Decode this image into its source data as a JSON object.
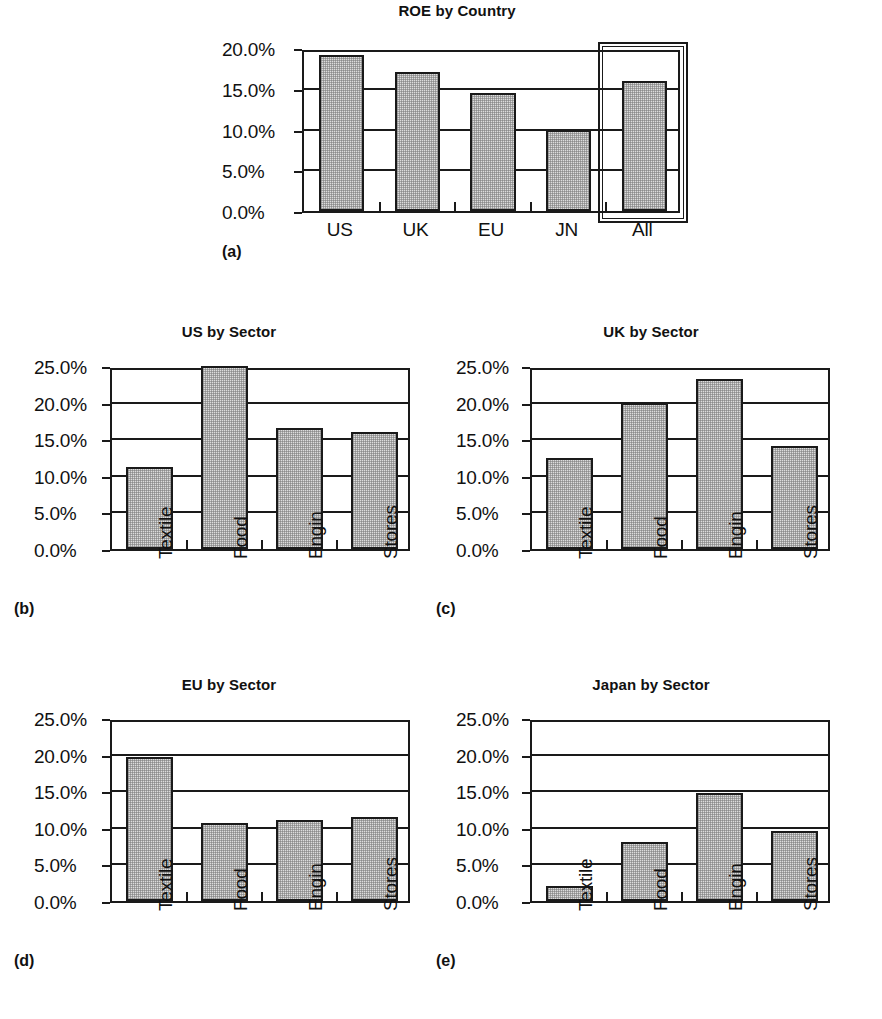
{
  "figure": {
    "background_color": "#ffffff",
    "ink_color": "#1a1a1a",
    "bar_fill_color": "#dcdcdc",
    "bar_border_color": "#1a1a1a"
  },
  "chart_data": [
    {
      "id": "a",
      "panel_tag": "(a)",
      "type": "bar",
      "title": "ROE by Country",
      "xlabel": "",
      "ylabel": "",
      "categories": [
        "US",
        "UK",
        "EU",
        "JN",
        "All"
      ],
      "values": [
        19.2,
        17.1,
        14.5,
        10.0,
        16.0
      ],
      "ylim": [
        0.0,
        20.0
      ],
      "yticks": [
        0.0,
        5.0,
        10.0,
        15.0,
        20.0
      ],
      "ytick_labels": [
        "0.0%",
        "5.0%",
        "10.0%",
        "15.0%",
        "20.0%"
      ],
      "grid": true,
      "legend": "none",
      "tick_label_rotation": 0,
      "annotations": [
        {
          "kind": "highlight-box",
          "target_category": "All",
          "note": "double-line rectangle drawn around the All column"
        }
      ]
    },
    {
      "id": "b",
      "panel_tag": "(b)",
      "type": "bar",
      "title": "US by Sector",
      "xlabel": "",
      "ylabel": "",
      "categories": [
        "Textile",
        "Food",
        "Engin",
        "Stores"
      ],
      "values": [
        11.2,
        25.0,
        16.5,
        16.0
      ],
      "ylim": [
        0.0,
        25.0
      ],
      "yticks": [
        0.0,
        5.0,
        10.0,
        15.0,
        20.0,
        25.0
      ],
      "ytick_labels": [
        "0.0%",
        "5.0%",
        "10.0%",
        "15.0%",
        "20.0%",
        "25.0%"
      ],
      "grid": true,
      "legend": "none",
      "tick_label_rotation": 90
    },
    {
      "id": "c",
      "panel_tag": "(c)",
      "type": "bar",
      "title": "UK by Sector",
      "xlabel": "",
      "ylabel": "",
      "categories": [
        "Textile",
        "Food",
        "Engin",
        "Stores"
      ],
      "values": [
        12.5,
        20.0,
        23.2,
        14.1
      ],
      "ylim": [
        0.0,
        25.0
      ],
      "yticks": [
        0.0,
        5.0,
        10.0,
        15.0,
        20.0,
        25.0
      ],
      "ytick_labels": [
        "0.0%",
        "5.0%",
        "10.0%",
        "15.0%",
        "20.0%",
        "25.0%"
      ],
      "grid": true,
      "legend": "none",
      "tick_label_rotation": 90
    },
    {
      "id": "d",
      "panel_tag": "(d)",
      "type": "bar",
      "title": "EU by Sector",
      "xlabel": "",
      "ylabel": "",
      "categories": [
        "Textile",
        "Food",
        "Engin",
        "Stores"
      ],
      "values": [
        19.7,
        10.6,
        11.0,
        11.5
      ],
      "ylim": [
        0.0,
        25.0
      ],
      "yticks": [
        0.0,
        5.0,
        10.0,
        15.0,
        20.0,
        25.0
      ],
      "ytick_labels": [
        "0.0%",
        "5.0%",
        "10.0%",
        "15.0%",
        "20.0%",
        "25.0%"
      ],
      "grid": true,
      "legend": "none",
      "tick_label_rotation": 90
    },
    {
      "id": "e",
      "panel_tag": "(e)",
      "type": "bar",
      "title": "Japan by Sector",
      "xlabel": "",
      "ylabel": "",
      "categories": [
        "Textile",
        "Food",
        "Engin",
        "Stores"
      ],
      "values": [
        2.0,
        8.1,
        14.7,
        9.6
      ],
      "ylim": [
        0.0,
        25.0
      ],
      "yticks": [
        0.0,
        5.0,
        10.0,
        15.0,
        20.0,
        25.0
      ],
      "ytick_labels": [
        "0.0%",
        "5.0%",
        "10.0%",
        "15.0%",
        "20.0%",
        "25.0%"
      ],
      "grid": true,
      "legend": "none",
      "tick_label_rotation": 90
    }
  ]
}
